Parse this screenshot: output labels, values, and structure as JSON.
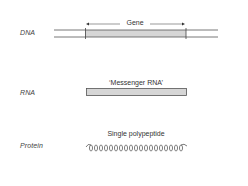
{
  "diagram": {
    "rows": [
      {
        "id": "dna",
        "label": "DNA",
        "annotation": "Gene"
      },
      {
        "id": "rna",
        "label": "RNA",
        "annotation": "‘Messenger RNA’"
      },
      {
        "id": "protein",
        "label": "Protein",
        "annotation": "Single polypeptide"
      }
    ],
    "colors": {
      "line": "#555555",
      "fill": "#d6d6d6",
      "text": "#333333"
    }
  }
}
